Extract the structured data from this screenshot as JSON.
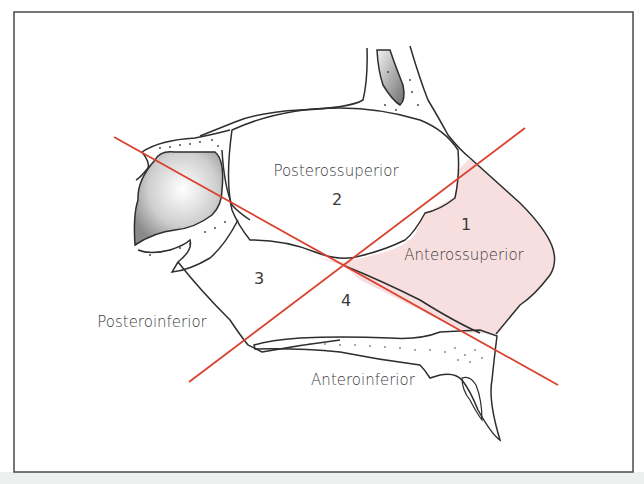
{
  "figure": {
    "regions": [
      {
        "number": "1",
        "label": "Anterossuperior"
      },
      {
        "number": "2",
        "label": "Posterossuperior"
      },
      {
        "number": "3",
        "label": "Posteroinferior"
      },
      {
        "number": "4",
        "label": "Anteroinferior"
      }
    ],
    "colors": {
      "dividing_lines": "#d9412e",
      "highlight_region": "#f7dfe0",
      "outline": "#2e2e2e",
      "frame": "#4a4a4a",
      "sinus_shade": "#9a9a9a"
    }
  }
}
